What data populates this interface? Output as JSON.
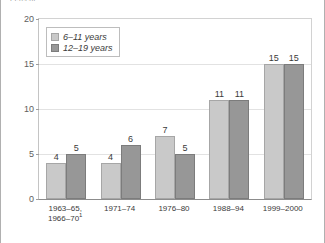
{
  "figure": {
    "axis_caption": "Percent",
    "frame_color": "#b0b0b0",
    "background": "#ffffff"
  },
  "legend": {
    "position": "top-left-inside",
    "entries": [
      {
        "label": "6–11 years",
        "color": "#c9c9c9",
        "swatch_name": "legend-swatch-6-11"
      },
      {
        "label": "12–19 years",
        "color": "#979797",
        "swatch_name": "legend-swatch-12-19"
      }
    ]
  },
  "yaxis": {
    "ticks": [
      "0",
      "5",
      "10",
      "15",
      "20"
    ],
    "min": 0,
    "max": 20
  },
  "chart_data": {
    "type": "bar",
    "title": "",
    "subtitle": "",
    "xlabel": "",
    "ylabel": "Percent",
    "ylim": [
      0,
      20
    ],
    "ytick_values": [
      0,
      5,
      10,
      15,
      20
    ],
    "grid": true,
    "legend_position": "upper left",
    "categories": [
      "1963–65, 1966–70",
      "1971–74",
      "1976–80",
      "1988–94",
      "1999–2000"
    ],
    "category_lines": [
      [
        "1963–65,",
        "1966–70"
      ],
      [
        "1971–74"
      ],
      [
        "1976–80"
      ],
      [
        "1988–94"
      ],
      [
        "1999–2000"
      ]
    ],
    "category_footnotes": [
      "1",
      "",
      "",
      "",
      ""
    ],
    "series": [
      {
        "name": "6–11 years",
        "color": "#c9c9c9",
        "values": [
          4,
          4,
          7,
          11,
          15
        ],
        "labels": [
          "4",
          "4",
          "7",
          "11",
          "15"
        ]
      },
      {
        "name": "12–19 years",
        "color": "#979797",
        "values": [
          5,
          6,
          5,
          11,
          15
        ],
        "labels": [
          "5",
          "6",
          "5",
          "11",
          "15"
        ]
      }
    ]
  }
}
